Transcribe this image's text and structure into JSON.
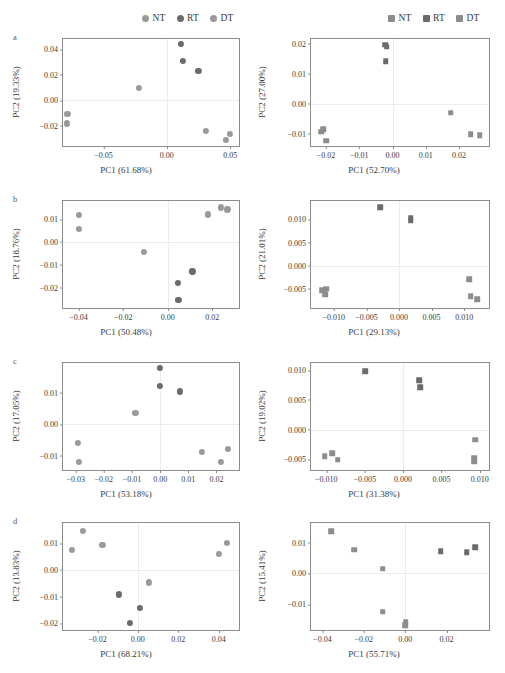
{
  "figure": {
    "panel_letters": [
      "a",
      "b",
      "c",
      "d"
    ],
    "colors": {
      "NT": "#9a9a9a",
      "RT": "#6b6b6b",
      "DT": "#9a9a9a",
      "axis": "#8c8c8c",
      "grid": "#ececec",
      "text": "#3a3a3a"
    }
  },
  "legend_left": {
    "marker": "circle-marker",
    "items": [
      {
        "label": "NT",
        "color": "#9a9a9a"
      },
      {
        "label": "RT",
        "color": "#6b6b6b"
      },
      {
        "label": "DT",
        "color": "#9a9a9a"
      }
    ]
  },
  "legend_right": {
    "marker": "square-marker",
    "items": [
      {
        "label": "NT",
        "color": "#8d8d8d"
      },
      {
        "label": "RT",
        "color": "#6b6b6b"
      },
      {
        "label": "DT",
        "color": "#8d8d8d"
      }
    ]
  },
  "chart_data": [
    {
      "id": "a-left",
      "panel": "a",
      "column": "left",
      "type": "scatter",
      "title": "",
      "xlabel": "PC1 (61.68%)",
      "ylabel": "PC2 (19.33%)",
      "xlim": [
        -0.082,
        0.057
      ],
      "ylim": [
        -0.036,
        0.048
      ],
      "xticks": [
        -0.05,
        0.0,
        0.05
      ],
      "xticklabels": [
        "−0.05",
        "0.00",
        "0.05"
      ],
      "yticks": [
        -0.02,
        0.0,
        0.02,
        0.04
      ],
      "yticklabels": [
        "−0.02",
        "0.00",
        "0.02",
        "0.04"
      ],
      "grid": true,
      "marker": "circle",
      "series": [
        {
          "name": "NT",
          "color": "#9a9a9a",
          "points": [
            [
              -0.0785,
              -0.0105
            ],
            [
              -0.079,
              -0.0182
            ],
            [
              -0.0222,
              0.0097
            ]
          ]
        },
        {
          "name": "RT",
          "color": "#6b6b6b",
          "points": [
            [
              0.0112,
              0.044
            ],
            [
              0.0125,
              0.0306
            ],
            [
              0.025,
              0.0232
            ]
          ]
        },
        {
          "name": "DT",
          "color": "#9a9a9a",
          "points": [
            [
              0.031,
              -0.024
            ],
            [
              0.0498,
              -0.0262
            ],
            [
              0.0468,
              -0.031
            ]
          ]
        }
      ]
    },
    {
      "id": "a-right",
      "panel": "a",
      "column": "right",
      "type": "scatter",
      "title": "",
      "xlabel": "PC1 (52.70%)",
      "ylabel": "PC2 (27.00%)",
      "xlim": [
        -0.0245,
        0.029
      ],
      "ylim": [
        -0.014,
        0.0215
      ],
      "xticks": [
        -0.02,
        -0.01,
        0.0,
        0.01,
        0.02
      ],
      "xticklabels": [
        "−0.02",
        "−0.01",
        "0.00",
        "0.01",
        "0.02"
      ],
      "yticks": [
        -0.01,
        0.0,
        0.01,
        0.02
      ],
      "yticklabels": [
        "−0.01",
        "0.00",
        "0.01",
        "0.02"
      ],
      "grid": true,
      "marker": "square",
      "series": [
        {
          "name": "NT",
          "color": "#8d8d8d",
          "points": [
            [
              -0.0215,
              -0.0092
            ],
            [
              -0.0208,
              -0.0085
            ],
            [
              -0.02,
              -0.0122
            ]
          ]
        },
        {
          "name": "RT",
          "color": "#6b6b6b",
          "points": [
            [
              -0.0022,
              0.0196
            ],
            [
              -0.0018,
              0.019
            ],
            [
              -0.002,
              0.0141
            ]
          ]
        },
        {
          "name": "DT",
          "color": "#8d8d8d",
          "points": [
            [
              0.0175,
              -0.003
            ],
            [
              0.0235,
              -0.01
            ],
            [
              0.0262,
              -0.0105
            ]
          ]
        }
      ]
    },
    {
      "id": "b-left",
      "panel": "b",
      "column": "left",
      "type": "scatter",
      "title": "",
      "xlabel": "PC1 (50.48%)",
      "ylabel": "PC2 (18.76%)",
      "xlim": [
        -0.047,
        0.032
      ],
      "ylim": [
        -0.029,
        0.018
      ],
      "xticks": [
        -0.04,
        -0.02,
        0.0,
        0.02
      ],
      "xticklabels": [
        "−0.04",
        "−0.02",
        "0.00",
        "0.02"
      ],
      "yticks": [
        -0.02,
        -0.01,
        0.0,
        0.01
      ],
      "yticklabels": [
        "−0.02",
        "−0.01",
        "0.00",
        "0.01"
      ],
      "grid": true,
      "marker": "circle",
      "series": [
        {
          "name": "NT",
          "color": "#9a9a9a",
          "points": [
            [
              -0.0398,
              0.0118
            ],
            [
              -0.04,
              0.0056
            ],
            [
              -0.0108,
              -0.0045
            ]
          ]
        },
        {
          "name": "RT",
          "color": "#6b6b6b",
          "points": [
            [
              0.0111,
              -0.0129
            ],
            [
              0.0046,
              -0.0178
            ],
            [
              0.0048,
              -0.0255
            ]
          ]
        },
        {
          "name": "DT",
          "color": "#9a9a9a",
          "points": [
            [
              0.018,
              0.0121
            ],
            [
              0.024,
              0.0152
            ],
            [
              0.0268,
              0.0143
            ]
          ]
        }
      ]
    },
    {
      "id": "b-right",
      "panel": "b",
      "column": "right",
      "type": "scatter",
      "title": "",
      "xlabel": "PC1 (29.13%)",
      "ylabel": "PC2 (21.01%)",
      "xlim": [
        -0.0135,
        0.0138
      ],
      "ylim": [
        -0.0092,
        0.014
      ],
      "xticks": [
        -0.01,
        -0.005,
        0.0,
        0.005,
        0.01
      ],
      "xticklabels": [
        "−0.010",
        "−0.005",
        "0.000",
        "0.005",
        "0.010"
      ],
      "yticks": [
        -0.005,
        0.0,
        0.005,
        0.01
      ],
      "yticklabels": [
        "−0.005",
        "0.000",
        "0.005",
        "0.010"
      ],
      "grid": true,
      "marker": "square",
      "series": [
        {
          "name": "NT",
          "color": "#8d8d8d",
          "points": [
            [
              -0.0118,
              -0.0053
            ],
            [
              -0.0112,
              -0.005
            ],
            [
              -0.0113,
              -0.0062
            ]
          ]
        },
        {
          "name": "RT",
          "color": "#6b6b6b",
          "points": [
            [
              -0.0029,
              0.0127
            ],
            [
              0.0018,
              0.0104
            ],
            [
              0.0018,
              0.0097
            ]
          ]
        },
        {
          "name": "DT",
          "color": "#8d8d8d",
          "points": [
            [
              0.0108,
              -0.003
            ],
            [
              0.011,
              -0.0066
            ],
            [
              0.012,
              -0.0073
            ]
          ]
        }
      ]
    },
    {
      "id": "c-left",
      "panel": "c",
      "column": "left",
      "type": "scatter",
      "title": "",
      "xlabel": "PC1 (53.18%)",
      "ylabel": "PC2 (17.05%)",
      "xlim": [
        -0.0345,
        0.028
      ],
      "ylim": [
        -0.0145,
        0.0195
      ],
      "xticks": [
        -0.03,
        -0.02,
        -0.01,
        0.0,
        0.01,
        0.02
      ],
      "xticklabels": [
        "−0.03",
        "−0.02",
        "−0.01",
        "0.00",
        "0.01",
        "0.02"
      ],
      "yticks": [
        -0.01,
        0.0,
        0.01
      ],
      "yticklabels": [
        "−0.01",
        "0.00",
        "0.01"
      ],
      "grid": true,
      "marker": "circle",
      "series": [
        {
          "name": "NT",
          "color": "#9a9a9a",
          "points": [
            [
              -0.0292,
              -0.0058
            ],
            [
              -0.0288,
              -0.0118
            ],
            [
              -0.0088,
              0.0037
            ]
          ]
        },
        {
          "name": "RT",
          "color": "#6b6b6b",
          "points": [
            [
              0.0,
              0.018
            ],
            [
              0.0,
              0.0121
            ],
            [
              0.007,
              0.0105
            ]
          ]
        },
        {
          "name": "DT",
          "color": "#9a9a9a",
          "points": [
            [
              0.0148,
              -0.0088
            ],
            [
              0.0215,
              -0.0118
            ],
            [
              0.024,
              -0.0077
            ]
          ]
        }
      ]
    },
    {
      "id": "c-right",
      "panel": "c",
      "column": "right",
      "type": "scatter",
      "title": "",
      "xlabel": "PC1 (31.38%)",
      "ylabel": "PC2 (19.02%)",
      "xlim": [
        -0.012,
        0.0112
      ],
      "ylim": [
        -0.0068,
        0.0112
      ],
      "xticks": [
        -0.01,
        -0.005,
        0.0,
        0.005,
        0.01
      ],
      "xticklabels": [
        "−0.010",
        "−0.005",
        "0.000",
        "0.005",
        "0.010"
      ],
      "yticks": [
        -0.005,
        0.0,
        0.005,
        0.01
      ],
      "yticklabels": [
        "−0.005",
        "0.000",
        "0.005",
        "0.010"
      ],
      "grid": true,
      "marker": "square",
      "series": [
        {
          "name": "NT",
          "color": "#8d8d8d",
          "points": [
            [
              -0.0102,
              -0.0045
            ],
            [
              -0.0092,
              -0.004
            ],
            [
              -0.0085,
              -0.0051
            ]
          ]
        },
        {
          "name": "RT",
          "color": "#6b6b6b",
          "points": [
            [
              -0.0049,
              0.0098
            ],
            [
              0.0021,
              0.0083
            ],
            [
              0.0022,
              0.0071
            ]
          ]
        },
        {
          "name": "DT",
          "color": "#8d8d8d",
          "points": [
            [
              0.0094,
              -0.0017
            ],
            [
              0.0093,
              -0.0047
            ],
            [
              0.0093,
              -0.0054
            ]
          ]
        }
      ]
    },
    {
      "id": "d-left",
      "panel": "d",
      "column": "left",
      "type": "scatter",
      "title": "",
      "xlabel": "PC1 (68.21%)",
      "ylabel": "PC2 (13.83%)",
      "xlim": [
        -0.037,
        0.05
      ],
      "ylim": [
        -0.0225,
        0.0175
      ],
      "xticks": [
        -0.02,
        0.0,
        0.02,
        0.04
      ],
      "xticklabels": [
        "−0.02",
        "0.00",
        "0.02",
        "0.04"
      ],
      "yticks": [
        -0.02,
        -0.01,
        0.0,
        0.01
      ],
      "yticklabels": [
        "−0.02",
        "−0.01",
        "0.00",
        "0.01"
      ],
      "grid": true,
      "marker": "circle",
      "series": [
        {
          "name": "NT",
          "color": "#9a9a9a",
          "points": [
            [
              -0.0325,
              0.0073
            ],
            [
              -0.027,
              0.0144
            ],
            [
              -0.0175,
              0.0092
            ]
          ]
        },
        {
          "name": "RT",
          "color": "#6b6b6b",
          "points": [
            [
              -0.0092,
              -0.0092
            ],
            [
              0.001,
              -0.0143
            ],
            [
              -0.004,
              -0.0198
            ]
          ]
        },
        {
          "name": "DT",
          "color": "#9a9a9a",
          "points": [
            [
              0.0055,
              -0.0047
            ],
            [
              0.04,
              0.0058
            ],
            [
              0.044,
              0.0101
            ]
          ]
        }
      ]
    },
    {
      "id": "d-right",
      "panel": "d",
      "column": "right",
      "type": "scatter",
      "title": "",
      "xlabel": "PC1 (55.71%)",
      "ylabel": "PC2 (15.41%)",
      "xlim": [
        -0.0455,
        0.0405
      ],
      "ylim": [
        -0.0185,
        0.0165
      ],
      "xticks": [
        -0.04,
        -0.02,
        0.0,
        0.02
      ],
      "xticklabels": [
        "−0.04",
        "−0.02",
        "0.00",
        "0.02"
      ],
      "yticks": [
        -0.01,
        0.0,
        0.01
      ],
      "yticklabels": [
        "−0.01",
        "0.00",
        "0.01"
      ],
      "grid": true,
      "marker": "square",
      "series": [
        {
          "name": "NT",
          "color": "#8d8d8d",
          "points": [
            [
              -0.0358,
              0.0139
            ],
            [
              -0.0245,
              0.0078
            ],
            [
              -0.0108,
              0.0016
            ]
          ]
        },
        {
          "name": "RT",
          "color": "#6b6b6b",
          "points": [
            [
              0.0172,
              0.0072
            ],
            [
              0.0298,
              0.0069
            ],
            [
              0.0338,
              0.0086
            ]
          ]
        },
        {
          "name": "DT",
          "color": "#8d8d8d",
          "points": [
            [
              -0.0108,
              -0.0125
            ],
            [
              0.0002,
              -0.0158
            ],
            [
              0.0,
              -0.017
            ]
          ]
        }
      ]
    }
  ]
}
